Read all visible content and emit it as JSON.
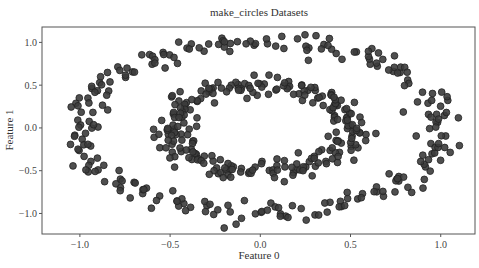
{
  "chart_data": {
    "type": "scatter",
    "title": "make_circles Datasets",
    "xlabel": "Feature 0",
    "ylabel": "Feature 1",
    "xlim": [
      -1.21,
      1.19
    ],
    "ylim": [
      -1.24,
      1.18
    ],
    "xticks": [
      -1.0,
      -0.5,
      0.0,
      0.5,
      1.0
    ],
    "xtick_labels": [
      "−1.0",
      "−0.5",
      "0.0",
      "0.5",
      "1.0"
    ],
    "yticks": [
      -1.0,
      -0.5,
      0.0,
      0.5,
      1.0
    ],
    "ytick_labels": [
      "−1.0",
      "−0.5",
      "0.0",
      "0.5",
      "1.0"
    ],
    "grid": false,
    "legend": null,
    "marker_color": "#3c3c3c",
    "marker_edge": "#222222",
    "series": [
      {
        "name": "outer circle",
        "radius": 1.0,
        "noise": 0.06,
        "n": 250
      },
      {
        "name": "inner circle",
        "radius": 0.5,
        "noise": 0.06,
        "n": 250
      }
    ]
  }
}
